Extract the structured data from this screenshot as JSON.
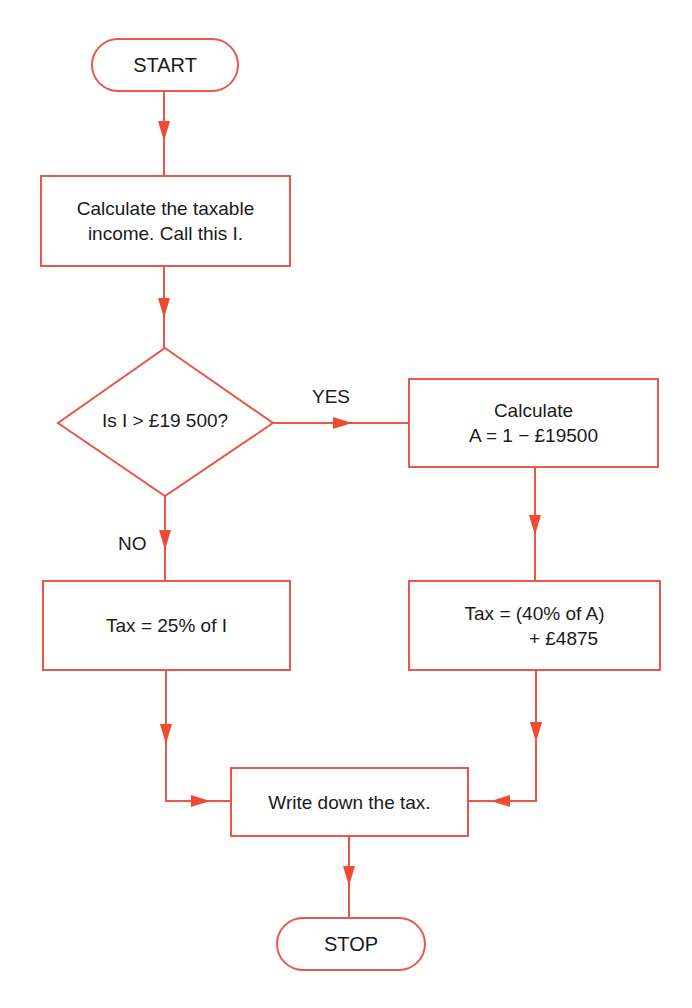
{
  "colors": {
    "stroke": "#e8574a",
    "arrow": "#f04a30",
    "text": "#1a1a1a",
    "background": "#ffffff"
  },
  "flowchart": {
    "start": {
      "label": "START"
    },
    "calc_income": {
      "line1": "Calculate the taxable",
      "line2": "income. Call this I."
    },
    "decision": {
      "label": "Is I > £19 500?"
    },
    "branch_yes": {
      "label": "YES"
    },
    "branch_no": {
      "label": "NO"
    },
    "calc_a": {
      "line1": "Calculate",
      "line2": "A = 1 − £19500"
    },
    "tax_low": {
      "label": "Tax = 25% of I"
    },
    "tax_high": {
      "line1": "Tax = (40% of A)",
      "line2": "+ £4875"
    },
    "write_tax": {
      "label": "Write down the tax."
    },
    "stop": {
      "label": "STOP"
    }
  }
}
